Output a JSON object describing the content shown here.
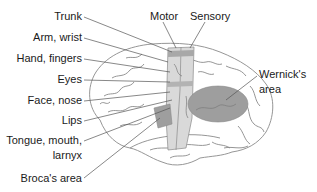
{
  "diagram": {
    "top_labels": {
      "motor": "Motor",
      "sensory": "Sensory"
    },
    "left_labels": [
      {
        "id": "trunk",
        "text": "Trunk"
      },
      {
        "id": "arm-wrist",
        "text": "Arm, wrist"
      },
      {
        "id": "hand-fingers",
        "text": "Hand, fingers"
      },
      {
        "id": "eyes",
        "text": "Eyes"
      },
      {
        "id": "face-nose",
        "text": "Face, nose"
      },
      {
        "id": "lips",
        "text": "Lips"
      },
      {
        "id": "tongue-mouth",
        "text": "Tongue, mouth,"
      },
      {
        "id": "larnyx",
        "text": "larnyx"
      },
      {
        "id": "brocas-area",
        "text": "Broca's area"
      }
    ],
    "right_labels": {
      "wernicks_line1": "Wernick's",
      "wernicks_line2": "area"
    },
    "colors": {
      "outline": "#8a8a8a",
      "leader_line": "#555555",
      "strip_light": "#d9d9d9",
      "strip_band": "#a8a8a8",
      "region_dark": "#9e9e9e",
      "text": "#1a1a1a"
    }
  }
}
